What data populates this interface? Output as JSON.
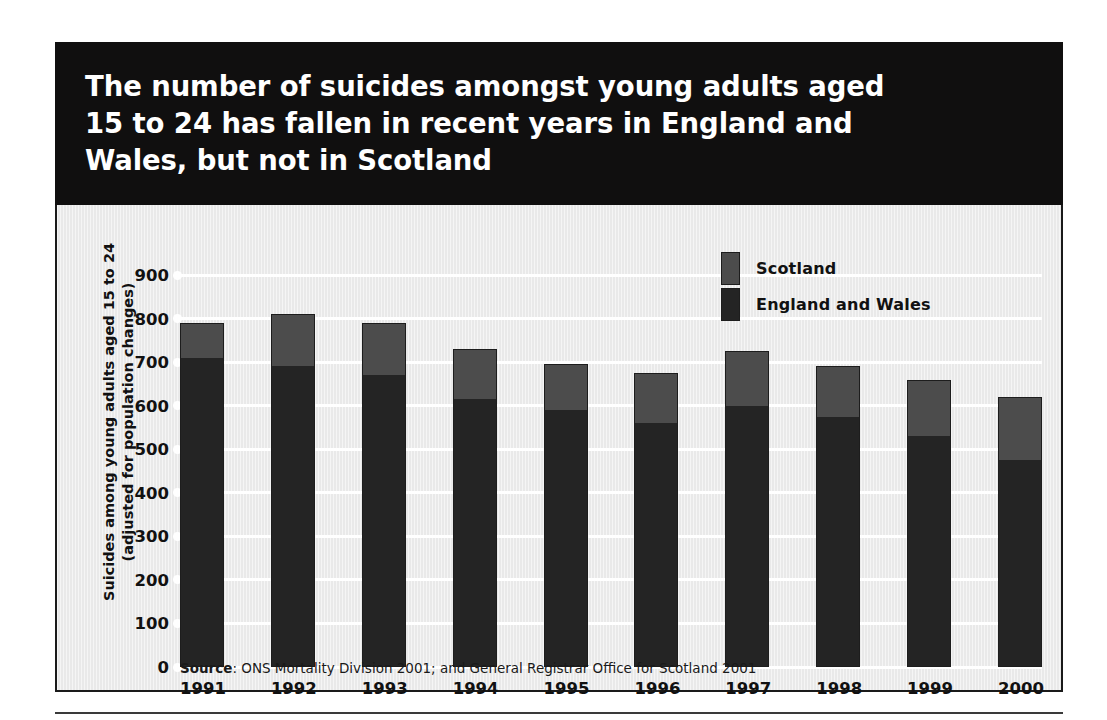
{
  "figure": {
    "title": "The number of suicides amongst young adults aged\n15 to 24 has fallen in recent years in England and\nWales, but not in Scotland",
    "source_prefix": "Source",
    "source_text": ": ONS Mortality Division 2001; and General Registrar Office for Scotland 2001"
  },
  "colors": {
    "banner_background": "#100f0f",
    "banner_text": "#ffffff",
    "panel_background": "#e9e9e9",
    "gridline": "#ffffff",
    "scotland": "#4c4c4c",
    "england_and_wales": "#242424",
    "outline": "#1d1d1d"
  },
  "chart_data": {
    "type": "bar",
    "title": "The number of suicides amongst young adults aged 15 to 24 has fallen in recent years in England and Wales, but not in Scotland",
    "subtitle": "",
    "stacked": true,
    "xlabel": "",
    "ylabel": "Suicides among young adults aged 15 to 24\n(adjusted for population changes)",
    "categories": [
      "1991",
      "1992",
      "1993",
      "1994",
      "1995",
      "1996",
      "1997",
      "1998",
      "1999",
      "2000"
    ],
    "series": [
      {
        "name": "England and Wales",
        "color": "#242424",
        "values": [
          710,
          690,
          670,
          615,
          590,
          560,
          600,
          575,
          530,
          475
        ]
      },
      {
        "name": "Scotland",
        "color": "#4c4c4c",
        "values": [
          80,
          120,
          120,
          115,
          105,
          115,
          125,
          115,
          130,
          145
        ]
      }
    ],
    "totals": [
      790,
      810,
      790,
      730,
      695,
      675,
      725,
      690,
      660,
      620
    ],
    "ylim": [
      0,
      900
    ],
    "yticks": [
      0,
      100,
      200,
      300,
      400,
      500,
      600,
      700,
      800,
      900
    ],
    "ytick_labels": [
      "0",
      "100",
      "200",
      "300",
      "400",
      "500",
      "600",
      "700",
      "800",
      "900"
    ],
    "grid": true,
    "grid_axis": "y",
    "legend_position": "upper right",
    "legend_entries": [
      "Scotland",
      "England and Wales"
    ]
  }
}
